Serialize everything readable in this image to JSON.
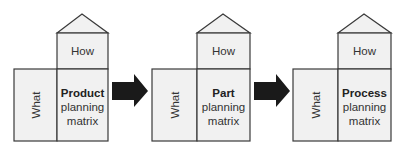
{
  "diagram": {
    "type": "flow",
    "colors": {
      "fill": "#f1f1f1",
      "stroke": "#3a3a3a",
      "arrow": "#1a1a1a"
    },
    "stages": [
      {
        "what_label": "What",
        "how_label": "How",
        "title": "Product",
        "line2": "planning",
        "line3": "matrix"
      },
      {
        "what_label": "What",
        "how_label": "How",
        "title": "Part",
        "line2": "planning",
        "line3": "matrix"
      },
      {
        "what_label": "What",
        "how_label": "How",
        "title": "Process",
        "line2": "planning",
        "line3": "matrix"
      }
    ],
    "connectors": [
      {
        "from": "Product planning matrix",
        "to": "Part planning matrix"
      },
      {
        "from": "Part planning matrix",
        "to": "Process planning matrix"
      }
    ]
  }
}
